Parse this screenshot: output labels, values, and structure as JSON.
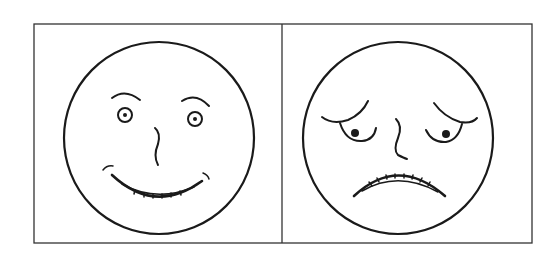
{
  "figure": {
    "panels": [
      {
        "id": "happy",
        "expression": "happy-face",
        "label": "Happy face"
      },
      {
        "id": "sad",
        "expression": "sad-face",
        "label": "Sad / worried face"
      }
    ],
    "colors": {
      "background": "#ffffff",
      "line": "#1a1a1a",
      "frame": "#333333"
    }
  }
}
